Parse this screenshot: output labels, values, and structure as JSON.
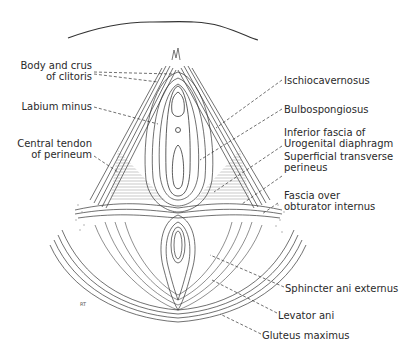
{
  "figure": {
    "type": "anatomical-illustration",
    "signature": "RT",
    "labels_left": [
      {
        "id": "body-crus-clitoris",
        "line1": "Body and crus",
        "line2": "of clitoris"
      },
      {
        "id": "labium-minus",
        "line1": "Labium minus",
        "line2": ""
      },
      {
        "id": "central-tendon",
        "line1": "Central tendon",
        "line2": "of perineum"
      }
    ],
    "labels_right": [
      {
        "id": "ischiocavernosus",
        "line1": "Ischiocavernosus",
        "line2": ""
      },
      {
        "id": "bulbospongiosus",
        "line1": "Bulbospongiosus",
        "line2": ""
      },
      {
        "id": "inferior-fascia",
        "line1": "Inferior fascia of",
        "line2": "Urogenital diaphragm"
      },
      {
        "id": "superficial-transverse",
        "line1": "Superficial transverse",
        "line2": "perineus"
      },
      {
        "id": "fascia-obturator",
        "line1": "Fascia over",
        "line2": "obturator internus"
      },
      {
        "id": "sphincter-ani",
        "line1": "Sphincter ani externus",
        "line2": ""
      },
      {
        "id": "levator-ani",
        "line1": "Levator ani",
        "line2": ""
      },
      {
        "id": "gluteus-maximus",
        "line1": "Gluteus maximus",
        "line2": ""
      }
    ],
    "colors": {
      "ink": "#2a2a2a",
      "background": "#ffffff",
      "shade": "#9a9a9a"
    }
  }
}
